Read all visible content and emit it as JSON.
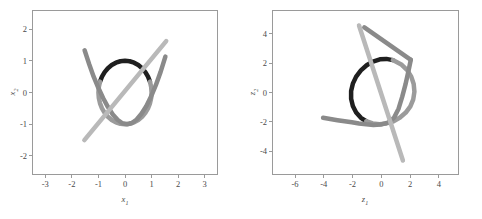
{
  "figure": {
    "background": "#ffffff",
    "frame_color": "#9a9a9a",
    "tick_color": "#4a4a4a"
  },
  "colors": {
    "dark_arc": "#1f1f1f",
    "mid_gray": "#8a8a8a",
    "light_gray": "#b9b9b9",
    "gray_curve": "#9b9b9b"
  },
  "chart_data": [
    {
      "type": "line",
      "id": "left-panel",
      "title": "",
      "xlabel": "x1",
      "ylabel": "x2",
      "xlim": [
        -3.5,
        3.5
      ],
      "ylim": [
        -2.6,
        2.6
      ],
      "xticks": [
        -3,
        -2,
        -1,
        0,
        1,
        2,
        3
      ],
      "xticklabels": [
        "-3",
        "-2",
        "-1",
        "0",
        "1",
        "2",
        "3"
      ],
      "yticks": [
        -2,
        -1,
        0,
        1,
        2
      ],
      "yticklabels": [
        "-2",
        "-1",
        "0",
        "1",
        "2"
      ],
      "grid": false,
      "legend": "none",
      "series": [
        {
          "name": "unit-circle-dark-arc",
          "color": "#1f1f1f",
          "width": 4.5,
          "comment": "upper arc of unit circle, radius 1, from angle 20deg to 160deg",
          "points": [
            [
              0.94,
              0.342
            ],
            [
              0.866,
              0.5
            ],
            [
              0.766,
              0.643
            ],
            [
              0.643,
              0.766
            ],
            [
              0.5,
              0.866
            ],
            [
              0.342,
              0.94
            ],
            [
              0.174,
              0.985
            ],
            [
              0.0,
              1.0
            ],
            [
              -0.174,
              0.985
            ],
            [
              -0.342,
              0.94
            ],
            [
              -0.5,
              0.866
            ],
            [
              -0.643,
              0.766
            ],
            [
              -0.766,
              0.643
            ],
            [
              -0.866,
              0.5
            ],
            [
              -0.94,
              0.342
            ]
          ]
        },
        {
          "name": "unit-circle-gray-arc",
          "color": "#9b9b9b",
          "width": 4.5,
          "comment": "lower arc of unit circle completing the ring",
          "points": [
            [
              -0.94,
              0.342
            ],
            [
              -0.985,
              0.174
            ],
            [
              -1.0,
              0.0
            ],
            [
              -0.985,
              -0.174
            ],
            [
              -0.94,
              -0.342
            ],
            [
              -0.866,
              -0.5
            ],
            [
              -0.766,
              -0.643
            ],
            [
              -0.643,
              -0.766
            ],
            [
              -0.5,
              -0.866
            ],
            [
              -0.342,
              -0.94
            ],
            [
              -0.174,
              -0.985
            ],
            [
              0.0,
              -1.0
            ],
            [
              0.174,
              -0.985
            ],
            [
              0.342,
              -0.94
            ],
            [
              0.5,
              -0.866
            ],
            [
              0.643,
              -0.766
            ],
            [
              0.766,
              -0.643
            ],
            [
              0.866,
              -0.5
            ],
            [
              0.94,
              -0.342
            ],
            [
              0.985,
              -0.174
            ],
            [
              1.0,
              0.0
            ],
            [
              0.985,
              0.174
            ],
            [
              0.94,
              0.342
            ]
          ]
        },
        {
          "name": "parabola-v-curve",
          "color": "#8a8a8a",
          "width": 4.5,
          "comment": "V-shaped parabola y = 0.62*x^2*sign-ish opening upward, vertex near (0.1,-1.0)",
          "points": [
            [
              -1.52,
              1.33
            ],
            [
              -1.35,
              0.9
            ],
            [
              -1.18,
              0.5
            ],
            [
              -1.0,
              0.14
            ],
            [
              -0.82,
              -0.18
            ],
            [
              -0.64,
              -0.46
            ],
            [
              -0.46,
              -0.69
            ],
            [
              -0.28,
              -0.86
            ],
            [
              -0.1,
              -0.97
            ],
            [
              0.08,
              -1.0
            ],
            [
              0.26,
              -0.96
            ],
            [
              0.44,
              -0.85
            ],
            [
              0.62,
              -0.67
            ],
            [
              0.8,
              -0.43
            ],
            [
              0.98,
              -0.13
            ],
            [
              1.16,
              0.23
            ],
            [
              1.34,
              0.65
            ],
            [
              1.52,
              1.13
            ]
          ]
        },
        {
          "name": "straight-line-light",
          "color": "#b9b9b9",
          "width": 4.5,
          "comment": "straight line of slope ~1.02 through origin-ish",
          "points": [
            [
              -1.53,
              -1.5
            ],
            [
              1.55,
              1.62
            ]
          ]
        }
      ]
    },
    {
      "type": "line",
      "id": "right-panel",
      "title": "",
      "xlabel": "z1",
      "ylabel": "z2",
      "xlim": [
        -7.6,
        5.4
      ],
      "ylim": [
        -5.6,
        5.6
      ],
      "xticks": [
        -6,
        -4,
        -2,
        0,
        2,
        4
      ],
      "xticklabels": [
        "-6",
        "-4",
        "-2",
        "0",
        "2",
        "4"
      ],
      "yticks": [
        -4,
        -2,
        0,
        2,
        4
      ],
      "yticklabels": [
        "-4",
        "-2",
        "0",
        "2",
        "4"
      ],
      "grid": false,
      "legend": "none",
      "series": [
        {
          "name": "circle-dark-arc",
          "color": "#1f1f1f",
          "width": 4.5,
          "comment": "dark left arc of transformed circle, centre approx (-0.2,0.1) radius 2.2",
          "points": [
            [
              0.8,
              2.2
            ],
            [
              0.35,
              2.28
            ],
            [
              -0.1,
              2.25
            ],
            [
              -0.58,
              2.1
            ],
            [
              -1.02,
              1.85
            ],
            [
              -1.42,
              1.5
            ],
            [
              -1.75,
              1.08
            ],
            [
              -1.98,
              0.6
            ],
            [
              -2.1,
              0.1
            ],
            [
              -2.1,
              -0.42
            ],
            [
              -1.98,
              -0.92
            ],
            [
              -1.75,
              -1.36
            ],
            [
              -1.42,
              -1.72
            ],
            [
              -1.05,
              -1.95
            ]
          ]
        },
        {
          "name": "circle-gray-arc",
          "color": "#9b9b9b",
          "width": 4.5,
          "comment": "gray right arc completing the transformed circle",
          "points": [
            [
              -1.05,
              -1.95
            ],
            [
              -0.6,
              -2.1
            ],
            [
              -0.12,
              -2.15
            ],
            [
              0.36,
              -2.1
            ],
            [
              0.85,
              -1.95
            ],
            [
              1.3,
              -1.7
            ],
            [
              1.7,
              -1.36
            ],
            [
              2.02,
              -0.94
            ],
            [
              2.22,
              -0.46
            ],
            [
              2.3,
              0.05
            ],
            [
              2.25,
              0.58
            ],
            [
              2.08,
              1.08
            ],
            [
              1.8,
              1.52
            ],
            [
              1.42,
              1.88
            ],
            [
              0.8,
              2.2
            ]
          ]
        },
        {
          "name": "flat-gray-curve",
          "color": "#8a8a8a",
          "width": 4.5,
          "comment": "nearly horizontal curve sweeping from left edge, dipping then rising to upper right",
          "points": [
            [
              -4.05,
              -1.72
            ],
            [
              -3.55,
              -1.8
            ],
            [
              -3.05,
              -1.88
            ],
            [
              -2.55,
              -1.95
            ],
            [
              -2.05,
              -2.02
            ],
            [
              -1.55,
              -2.1
            ],
            [
              -1.05,
              -2.16
            ],
            [
              -0.55,
              -2.2
            ],
            [
              -0.05,
              -2.18
            ],
            [
              0.45,
              -2.05
            ],
            [
              0.88,
              -1.72
            ],
            [
              1.2,
              -1.1
            ],
            [
              1.45,
              -0.3
            ],
            [
              1.68,
              0.55
            ],
            [
              1.88,
              1.42
            ],
            [
              2.05,
              2.22
            ]
          ]
        },
        {
          "name": "steep-line-light",
          "color": "#b9b9b9",
          "width": 4.5,
          "comment": "steep near-vertical line from upper-left to lower-right",
          "points": [
            [
              -1.55,
              4.55
            ],
            [
              1.5,
              -4.62
            ]
          ]
        },
        {
          "name": "steep-line-mid",
          "color": "#8a8a8a",
          "width": 4.5,
          "comment": "second steep line overlapping, slightly to the right at top",
          "points": [
            [
              -1.18,
              4.42
            ],
            [
              2.05,
              2.22
            ]
          ]
        }
      ]
    }
  ],
  "panels": [
    {
      "name": "left-plot",
      "xlabel": "x",
      "xlabel_sub": "1",
      "ylabel": "x",
      "ylabel_sub": "2"
    },
    {
      "name": "right-plot",
      "xlabel": "z",
      "xlabel_sub": "1",
      "ylabel": "z",
      "ylabel_sub": "2"
    }
  ]
}
